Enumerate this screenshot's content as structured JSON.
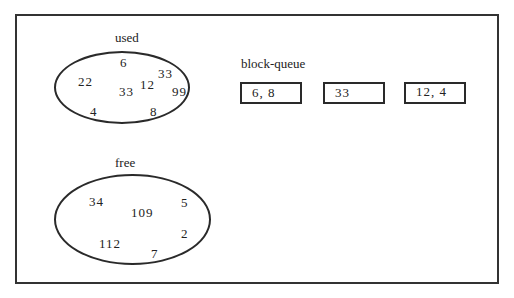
{
  "diagram": {
    "used": {
      "label": "used",
      "elements": [
        {
          "value": "6",
          "x": 120,
          "y": 55
        },
        {
          "value": "33",
          "x": 158,
          "y": 66
        },
        {
          "value": "22",
          "x": 78,
          "y": 74
        },
        {
          "value": "12",
          "x": 140,
          "y": 77
        },
        {
          "value": "99",
          "x": 172,
          "y": 84
        },
        {
          "value": "33",
          "x": 119,
          "y": 84
        },
        {
          "value": "4",
          "x": 90,
          "y": 104
        },
        {
          "value": "8",
          "x": 150,
          "y": 104
        }
      ]
    },
    "free": {
      "label": "free",
      "elements": [
        {
          "value": "34",
          "x": 89,
          "y": 194
        },
        {
          "value": "5",
          "x": 181,
          "y": 195
        },
        {
          "value": "109",
          "x": 131,
          "y": 205
        },
        {
          "value": "2",
          "x": 181,
          "y": 226
        },
        {
          "value": "112",
          "x": 99,
          "y": 236
        },
        {
          "value": "7",
          "x": 151,
          "y": 246
        }
      ]
    },
    "block_queue": {
      "label": "block-queue",
      "blocks": [
        "6, 8",
        "33",
        "12, 4"
      ]
    }
  }
}
